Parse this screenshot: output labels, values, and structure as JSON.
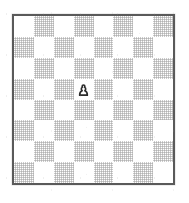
{
  "diagram": {
    "kind": "chess-board-diagram",
    "board": {
      "files": [
        "a",
        "b",
        "c",
        "d",
        "e",
        "f",
        "g",
        "h"
      ],
      "ranks": [
        "8",
        "7",
        "6",
        "5",
        "4",
        "3",
        "2",
        "1"
      ],
      "size": 8,
      "orientation": "white",
      "top_left_square_color": "light",
      "coordinates_shown": false,
      "border": true
    },
    "colors": {
      "light_square": "#ffffff",
      "dark_square": "#d8d8d8",
      "border": "#5a5a5a",
      "piece_outline": "#2b2b2b",
      "piece_fill": "#ffffff",
      "background": "#ffffff"
    },
    "pieces": [
      {
        "type": "pawn",
        "color": "white",
        "square": "d5",
        "file_index": 3,
        "rank_index": 3,
        "glyph": "white-pawn-icon",
        "unicode": "♙"
      }
    ],
    "piece_count": 1,
    "fen": "8/8/8/3P4/8/8/8/8 w - - 0 1"
  },
  "chart_data": {
    "type": "heatmap",
    "xlabel": "",
    "ylabel": "",
    "categories": [
      "a",
      "b",
      "c",
      "d",
      "e",
      "f",
      "g",
      "h"
    ],
    "rows": [
      "8",
      "7",
      "6",
      "5",
      "4",
      "3",
      "2",
      "1"
    ],
    "grid": true,
    "legend": "none",
    "values": [
      [
        0,
        1,
        0,
        1,
        0,
        1,
        0,
        1
      ],
      [
        1,
        0,
        1,
        0,
        1,
        0,
        1,
        0
      ],
      [
        0,
        1,
        0,
        1,
        0,
        1,
        0,
        1
      ],
      [
        1,
        0,
        1,
        0,
        1,
        0,
        1,
        0
      ],
      [
        0,
        1,
        0,
        1,
        0,
        1,
        0,
        1
      ],
      [
        1,
        0,
        1,
        0,
        1,
        0,
        1,
        0
      ],
      [
        0,
        1,
        0,
        1,
        0,
        1,
        0,
        1
      ],
      [
        1,
        0,
        1,
        0,
        1,
        0,
        1,
        0
      ]
    ],
    "annotations": [
      {
        "square": "d5",
        "label": "white pawn",
        "row": 3,
        "col": 3
      }
    ]
  }
}
